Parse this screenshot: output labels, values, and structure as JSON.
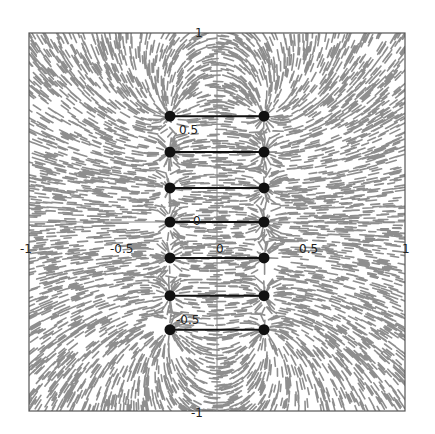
{
  "chart_data": {
    "type": "scatter",
    "title": "",
    "subtitle": "Electric field line texture (LIC-style) of a charge ladder: pairs of point charges connected by bars",
    "xlabel": "",
    "ylabel": "",
    "xlim": [
      -1,
      1
    ],
    "ylim": [
      -1,
      1
    ],
    "grid": false,
    "legend": null,
    "axes_through_origin": true,
    "x_ticks": [
      -1,
      -0.5,
      0,
      0.5,
      1
    ],
    "y_ticks": [
      -1,
      -0.5,
      0,
      0.5,
      1
    ],
    "x_tick_labels": [
      "-1",
      "-0.5",
      "0",
      "0.5",
      "1"
    ],
    "y_tick_labels": [
      "-1",
      "-0.5",
      "0",
      "0.5",
      "1"
    ],
    "series": [
      {
        "name": "charges-left",
        "x": [
          -0.25,
          -0.25,
          -0.25,
          -0.25,
          -0.25,
          -0.25,
          -0.25
        ],
        "y": [
          0.56,
          0.37,
          0.18,
          0.0,
          -0.19,
          -0.39,
          -0.57
        ]
      },
      {
        "name": "charges-right",
        "x": [
          0.25,
          0.25,
          0.25,
          0.25,
          0.25,
          0.25,
          0.25
        ],
        "y": [
          0.56,
          0.37,
          0.18,
          0.0,
          -0.19,
          -0.39,
          -0.57
        ]
      }
    ],
    "segments": [
      {
        "x": [
          -0.25,
          0.25
        ],
        "y": [
          0.56,
          0.56
        ]
      },
      {
        "x": [
          -0.25,
          0.25
        ],
        "y": [
          0.37,
          0.37
        ]
      },
      {
        "x": [
          -0.25,
          0.25
        ],
        "y": [
          0.18,
          0.18
        ]
      },
      {
        "x": [
          -0.25,
          0.25
        ],
        "y": [
          0.0,
          0.0
        ]
      },
      {
        "x": [
          -0.25,
          0.25
        ],
        "y": [
          -0.19,
          -0.19
        ]
      },
      {
        "x": [
          -0.25,
          0.25
        ],
        "y": [
          -0.39,
          -0.39
        ]
      },
      {
        "x": [
          -0.25,
          0.25
        ],
        "y": [
          -0.57,
          -0.57
        ]
      }
    ],
    "colors": {
      "texture": "#7a7a7a",
      "charge": "#111111",
      "bar": "#111111",
      "frame": "#555555",
      "axis": "#888888"
    }
  }
}
